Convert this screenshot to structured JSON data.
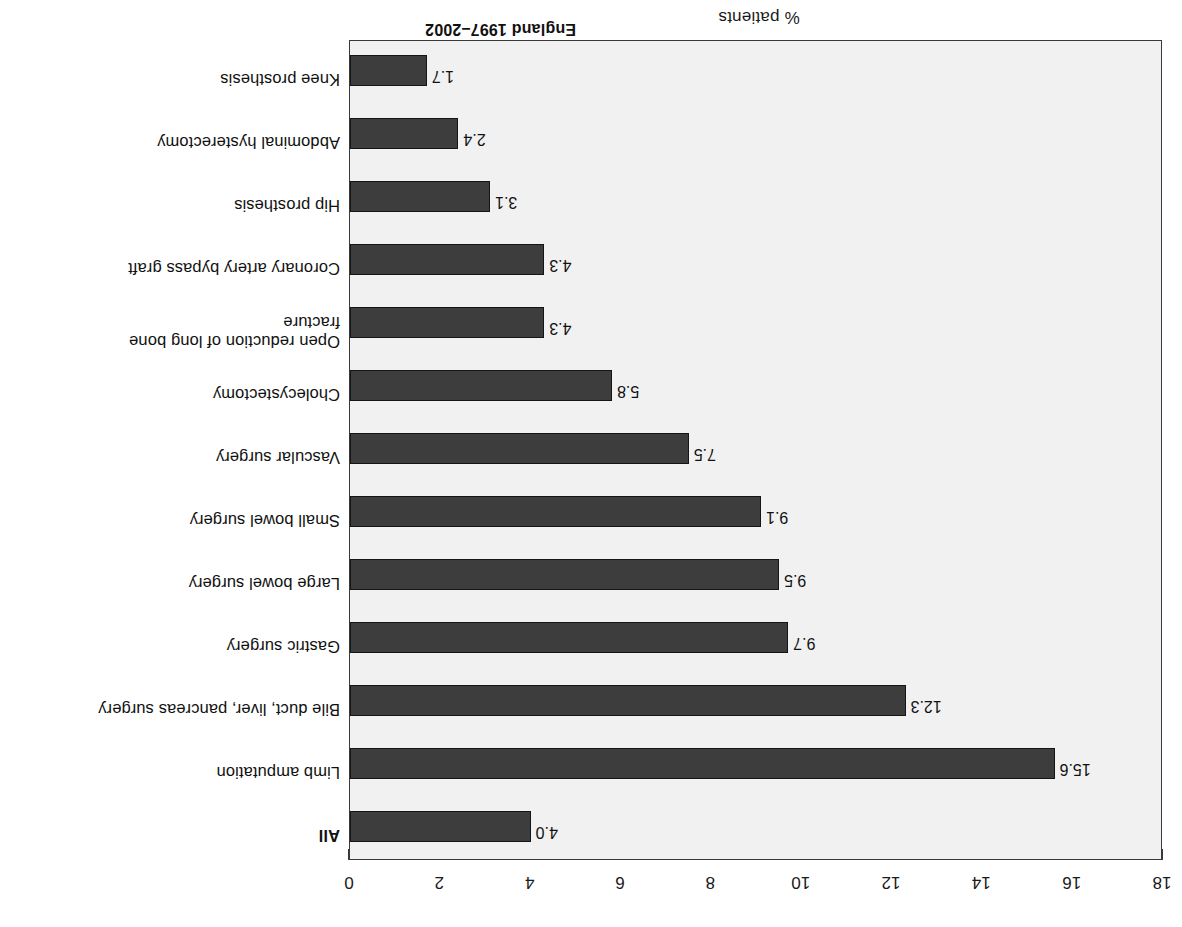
{
  "caption": "England 1997–2002",
  "axis": {
    "x_title": "% patients",
    "ticks": [
      0,
      2,
      4,
      6,
      8,
      10,
      12,
      14,
      16,
      18
    ],
    "min": 0,
    "max": 18
  },
  "colors": {
    "bar_fill": "#3d3d3d",
    "bar_stroke": "#151515",
    "plot_background": "#f1f1f1",
    "frame": "#3a3a3a",
    "text": "#111111"
  },
  "chart_data": {
    "type": "bar",
    "orientation": "horizontal",
    "title": "",
    "subtitle": "",
    "xlabel": "% patients",
    "ylabel": "",
    "xlim": [
      0,
      18
    ],
    "grid": false,
    "legend": "none",
    "annotation": "England 1997–2002",
    "note": "Chart is printed rotated 180 degrees (upside-down) on the page.",
    "categories": [
      "All",
      "Limb amputation",
      "Bile duct, liver, pancreas surgery",
      "Gastric surgery",
      "Large bowel surgery",
      "Small bowel surgery",
      "Vascular surgery",
      "Cholecystectomy",
      "Open reduction of long bone\nfracture",
      "Coronary artery bypass graft",
      "Hip prosthesis",
      "Abdominal hysterectomy",
      "Knee prosthesis"
    ],
    "values": [
      4.0,
      15.6,
      12.3,
      9.7,
      9.5,
      9.1,
      7.5,
      5.8,
      4.3,
      4.3,
      3.1,
      2.4,
      1.7
    ],
    "value_labels": [
      "4.0",
      "15.6",
      "12.3",
      "9.7",
      "9.5",
      "9.1",
      "7.5",
      "5.8",
      "4.3",
      "4.3",
      "3.1",
      "2.4",
      "1.7"
    ],
    "emphasis": [
      "All"
    ]
  }
}
